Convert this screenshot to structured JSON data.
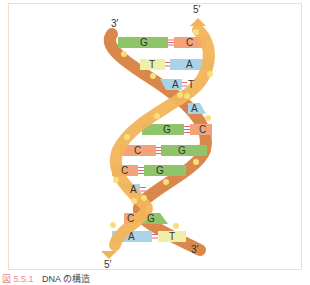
{
  "diagram": {
    "title": "DNA の構造",
    "figure_number": "図 5.5.1",
    "end_labels": {
      "top_left": "3′",
      "top_right": "5′",
      "bottom_left": "5′",
      "bottom_right": "3′"
    },
    "colors": {
      "frame_border": "#f3dcc8",
      "strand_dark": "#d9874a",
      "strand_light": "#f2b45a",
      "phosphate_dot": "#f7df7a",
      "base_G": "#8fc46a",
      "base_C": "#f2a37a",
      "base_A": "#a9d3e6",
      "base_T": "#eef0a8",
      "hbond": "#e0667a"
    },
    "base_pairs": [
      {
        "left": "G",
        "right": "C",
        "bonds": 3
      },
      {
        "left": "T",
        "right": "A",
        "bonds": 2
      },
      {
        "left": "A",
        "right": "T",
        "bonds": 2
      },
      {
        "left": "",
        "right": "A",
        "bonds": 2
      },
      {
        "left": "G",
        "right": "C",
        "bonds": 3
      },
      {
        "left": "C",
        "right": "G",
        "bonds": 3
      },
      {
        "left": "C",
        "right": "G",
        "bonds": 3
      },
      {
        "left": "A",
        "right": "",
        "bonds": 2
      },
      {
        "left": "C",
        "right": "G",
        "bonds": 3
      },
      {
        "left": "A",
        "right": "T",
        "bonds": 2
      }
    ]
  }
}
